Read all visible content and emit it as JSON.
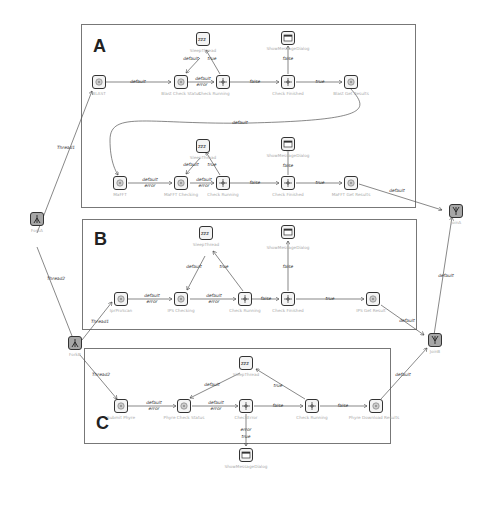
{
  "panels": [
    {
      "label": "A"
    },
    {
      "label": "B"
    },
    {
      "label": "C"
    }
  ],
  "nodes": {
    "forkA": {
      "label": "ForkA",
      "icon": "fork-icon"
    },
    "forkB": {
      "label": "ForkB",
      "icon": "fork-icon"
    },
    "joinA": {
      "label": "JoinA",
      "icon": "join-icon"
    },
    "joinB": {
      "label": "JoinB",
      "icon": "join-icon"
    },
    "a_blast": {
      "label": "BLAST",
      "icon": "gear-icon"
    },
    "a_check_status": {
      "label": "Blast Check Status",
      "icon": "gear-icon"
    },
    "a_sleep": {
      "label": "SleepThread",
      "icon": "sleep-icon"
    },
    "a_check_running": {
      "label": "Check Running",
      "icon": "decision-icon"
    },
    "a_check_finished": {
      "label": "Check Finished",
      "icon": "decision-icon"
    },
    "a_dialog": {
      "label": "ShowMessageDialog",
      "icon": "dialog-icon"
    },
    "a_get_results": {
      "label": "Blast Get Results",
      "icon": "gear-icon"
    },
    "a2_mafft": {
      "label": "MaFFT",
      "icon": "gear-icon"
    },
    "a2_checking": {
      "label": "MaFFT Checking",
      "icon": "gear-icon"
    },
    "a2_sleep": {
      "label": "SleepThread",
      "icon": "sleep-icon"
    },
    "a2_check_running": {
      "label": "Check Running",
      "icon": "decision-icon"
    },
    "a2_check_finished": {
      "label": "Check Finished",
      "icon": "decision-icon"
    },
    "a2_dialog": {
      "label": "ShowMessageDialog",
      "icon": "dialog-icon"
    },
    "a2_get_results": {
      "label": "MaFFT Get Results",
      "icon": "gear-icon"
    },
    "b_iprscan": {
      "label": "IprProScan",
      "icon": "gear-icon"
    },
    "b_checking": {
      "label": "IPS Checking",
      "icon": "gear-icon"
    },
    "b_sleep": {
      "label": "SleepThread",
      "icon": "sleep-icon"
    },
    "b_check_running": {
      "label": "Check Running",
      "icon": "decision-icon"
    },
    "b_check_finished": {
      "label": "Check Finished",
      "icon": "decision-icon"
    },
    "b_dialog": {
      "label": "ShowMessageDialog",
      "icon": "dialog-icon"
    },
    "b_get_result": {
      "label": "IPS Get Result",
      "icon": "gear-icon"
    },
    "c_submit": {
      "label": "Submit Phyre",
      "icon": "gear-icon"
    },
    "c_check_status": {
      "label": "Phyre Check Status",
      "icon": "gear-icon"
    },
    "c_sleep": {
      "label": "SleepThread",
      "icon": "sleep-icon"
    },
    "c_check_error": {
      "label": "CheckError",
      "icon": "decision-icon"
    },
    "c_check_running": {
      "label": "Check Running",
      "icon": "decision-icon"
    },
    "c_dialog": {
      "label": "ShowMessageDialog",
      "icon": "dialog-icon"
    },
    "c_download": {
      "label": "Phyre Download Results",
      "icon": "gear-icon"
    }
  },
  "edges": {
    "thread1_top": "Thread1",
    "thread2_top": "Thread2",
    "thread1_b": "Thread1",
    "thread2_c": "Thread2",
    "a_default1": "default",
    "a_default_error": [
      "default",
      "error"
    ],
    "a_sleep_default": "default",
    "a_sleep_true": "true",
    "a_false": "false",
    "a_true": "true",
    "a_dialog_false": "false",
    "a_loop_default": "default",
    "a2_default_error1": [
      "default",
      "error"
    ],
    "a2_default_error2": [
      "default",
      "error"
    ],
    "a2_sleep_default": "default",
    "a2_sleep_true": "true",
    "a2_false": "false",
    "a2_true": "true",
    "a2_dialog_false": "false",
    "a2_to_joinA": "default",
    "b_default_error1": [
      "default",
      "error"
    ],
    "b_default_error2": [
      "default",
      "error"
    ],
    "b_sleep_default": "default",
    "b_sleep_true": "true",
    "b_false": "false",
    "b_true": "true",
    "b_dialog_false": "false",
    "b_to_joinB": "default",
    "joinB_to_joinA": "default",
    "c_default_error1": [
      "default",
      "error"
    ],
    "c_default_error2": [
      "default",
      "error"
    ],
    "c_sleep_default": "default",
    "c_sleep_true": "true",
    "c_false1": "false",
    "c_false2": "false",
    "c_error_true": [
      "error",
      "true"
    ],
    "c_to_joinB": "default"
  }
}
